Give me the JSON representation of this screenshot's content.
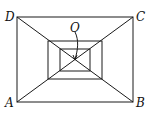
{
  "diagram": {
    "labels": {
      "A": "A",
      "B": "B",
      "C": "C",
      "D": "D",
      "O": "O"
    },
    "points": {
      "A": [
        17,
        102
      ],
      "B": [
        133,
        102
      ],
      "C": [
        133,
        17
      ],
      "D": [
        17,
        17
      ],
      "O": [
        75,
        60
      ]
    },
    "rectangles": [
      {
        "name": "outer",
        "x": 17,
        "y": 17,
        "w": 116,
        "h": 85
      },
      {
        "name": "middle",
        "x": 48,
        "y": 41,
        "w": 54,
        "h": 38
      },
      {
        "name": "inner",
        "x": 60,
        "y": 49,
        "w": 30,
        "h": 22
      }
    ],
    "colors": {
      "stroke": "#1a1a1a",
      "background": "#ffffff"
    }
  }
}
